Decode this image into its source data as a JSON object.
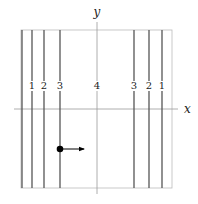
{
  "diagram": {
    "axes": {
      "x_label": "x",
      "y_label": "y"
    },
    "frame": {
      "left": 21,
      "right": 172,
      "top": 30,
      "bottom": 188,
      "color": "#bbbbbb"
    },
    "x_axis": {
      "y": 109,
      "x1": 14,
      "x2": 178,
      "color": "#999999"
    },
    "y_axis": {
      "x": 97,
      "y1": 22,
      "y2": 194,
      "color": "#999999"
    },
    "lines": [
      {
        "x": 22,
        "label": ""
      },
      {
        "x": 32,
        "label": "1"
      },
      {
        "x": 44,
        "label": "2"
      },
      {
        "x": 60,
        "label": "3"
      },
      {
        "x": 134,
        "label": "3"
      },
      {
        "x": 149,
        "label": "2"
      },
      {
        "x": 162,
        "label": "1"
      }
    ],
    "center_label": {
      "x": 97,
      "label": "4"
    },
    "label_y": 89,
    "line_color": "#555555",
    "point": {
      "x": 60,
      "y": 149,
      "color": "#000000"
    },
    "arrow": {
      "x1": 60,
      "y1": 149,
      "x2": 84,
      "y2": 149,
      "color": "#000000"
    }
  }
}
